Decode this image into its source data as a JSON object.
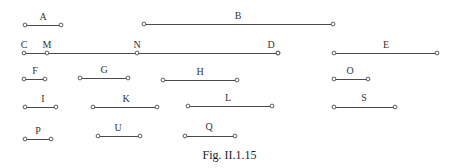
{
  "figure": {
    "caption": "Fig. II.1.15",
    "caption_x": 0,
    "caption_y": 148,
    "width": 459,
    "height": 168,
    "background_color": "#ffffff",
    "line_color": "#4a4a4a",
    "label_color": "#333333",
    "endpoint_fill": "#ffffff"
  },
  "chart_data": {
    "type": "interval-diagram",
    "title": "Fig. II.1.15",
    "xlabel": "",
    "ylabel": "",
    "rows": 5,
    "segments": [
      {
        "label": "A",
        "x1": 25,
        "x2": 61,
        "y": 25,
        "label_x": 43,
        "label_y": 12,
        "row": 1
      },
      {
        "label": "B",
        "x1": 144,
        "x2": 333,
        "y": 24,
        "label_x": 238,
        "label_y": 11,
        "row": 1
      },
      {
        "label": "C",
        "x1": 24,
        "x2": 278,
        "y": 53,
        "label_x": 24,
        "label_y": 40,
        "row": 2
      },
      {
        "label": "E",
        "x1": 334,
        "x2": 437,
        "y": 53,
        "label_x": 386,
        "label_y": 40,
        "row": 2
      },
      {
        "label": "F",
        "x1": 24,
        "x2": 45,
        "y": 79,
        "label_x": 35,
        "label_y": 66,
        "row": 3
      },
      {
        "label": "G",
        "x1": 80,
        "x2": 128,
        "y": 78,
        "label_x": 104,
        "label_y": 65,
        "row": 3
      },
      {
        "label": "H",
        "x1": 163,
        "x2": 237,
        "y": 80,
        "label_x": 200,
        "label_y": 67,
        "row": 3
      },
      {
        "label": "O",
        "x1": 334,
        "x2": 368,
        "y": 79,
        "label_x": 350,
        "label_y": 66,
        "row": 3
      },
      {
        "label": "I",
        "x1": 25,
        "x2": 56,
        "y": 107,
        "label_x": 43,
        "label_y": 94,
        "row": 4
      },
      {
        "label": "K",
        "x1": 93,
        "x2": 157,
        "y": 107,
        "label_x": 126,
        "label_y": 94,
        "row": 4
      },
      {
        "label": "L",
        "x1": 188,
        "x2": 272,
        "y": 106,
        "label_x": 228,
        "label_y": 93,
        "row": 4
      },
      {
        "label": "S",
        "x1": 334,
        "x2": 395,
        "y": 107,
        "label_x": 364,
        "label_y": 93,
        "row": 4
      },
      {
        "label": "P",
        "x1": 25,
        "x2": 51,
        "y": 139,
        "label_x": 38,
        "label_y": 126,
        "row": 5
      },
      {
        "label": "U",
        "x1": 98,
        "x2": 140,
        "y": 136,
        "label_x": 118,
        "label_y": 123,
        "row": 5
      },
      {
        "label": "Q",
        "x1": 185,
        "x2": 235,
        "y": 136,
        "label_x": 209,
        "label_y": 122,
        "row": 5
      }
    ],
    "interior_points": [
      {
        "label": "M",
        "x": 47,
        "y": 53,
        "on_segment": "C",
        "label_x": 47,
        "label_y": 40
      },
      {
        "label": "N",
        "x": 137,
        "y": 53,
        "on_segment": "C",
        "label_x": 137,
        "label_y": 40
      },
      {
        "label": "D",
        "x": 278,
        "y": 53,
        "on_segment": "C",
        "label_x": 271,
        "label_y": 40
      }
    ]
  }
}
